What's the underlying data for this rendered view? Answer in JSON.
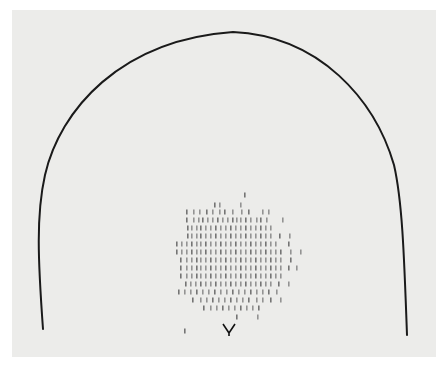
{
  "figure": {
    "background_color": "#ececea",
    "outline": {
      "color": "#1a1a1a",
      "stroke_width": 2,
      "path": "M43,329 C38,260 36,215 45,175 C60,110 120,40 233,32 C320,36 375,100 394,165 C402,200 404,250 407,335"
    },
    "tick_color": "#6e6e6e",
    "tick_rows": [
      {
        "y": 195,
        "xs": [
          244
        ]
      },
      {
        "y": 205,
        "xs": [
          214,
          219,
          240
        ]
      },
      {
        "y": 212,
        "xs": [
          186,
          193,
          199,
          206,
          212,
          219,
          224,
          232,
          241,
          248,
          262,
          268
        ]
      },
      {
        "y": 220,
        "xs": [
          186,
          193,
          198,
          202,
          207,
          212,
          217,
          222,
          227,
          232,
          236,
          240,
          245,
          250,
          256,
          260,
          266,
          282
        ]
      },
      {
        "y": 228,
        "xs": [
          187,
          191,
          196,
          200,
          205,
          210,
          215,
          220,
          225,
          230,
          235,
          240,
          245,
          250,
          255,
          260,
          265,
          270
        ]
      },
      {
        "y": 236,
        "xs": [
          187,
          191,
          196,
          200,
          205,
          210,
          215,
          220,
          225,
          230,
          235,
          240,
          245,
          250,
          255,
          260,
          265,
          270,
          279,
          289
        ]
      },
      {
        "y": 244,
        "xs": [
          176,
          181,
          186,
          191,
          196,
          200,
          205,
          210,
          215,
          220,
          225,
          230,
          235,
          240,
          245,
          250,
          255,
          260,
          265,
          270,
          275,
          288
        ]
      },
      {
        "y": 252,
        "xs": [
          176,
          181,
          186,
          191,
          196,
          200,
          205,
          210,
          215,
          220,
          225,
          230,
          235,
          240,
          245,
          250,
          255,
          260,
          265,
          270,
          275,
          280,
          290,
          300
        ]
      },
      {
        "y": 260,
        "xs": [
          180,
          186,
          191,
          196,
          200,
          205,
          210,
          215,
          220,
          225,
          230,
          235,
          240,
          245,
          250,
          255,
          260,
          265,
          270,
          275,
          280,
          290
        ]
      },
      {
        "y": 268,
        "xs": [
          180,
          186,
          191,
          196,
          200,
          205,
          210,
          215,
          220,
          225,
          230,
          235,
          240,
          245,
          250,
          255,
          260,
          265,
          270,
          275,
          280,
          288,
          296
        ]
      },
      {
        "y": 276,
        "xs": [
          180,
          186,
          191,
          196,
          200,
          205,
          210,
          215,
          220,
          225,
          230,
          235,
          240,
          245,
          250,
          255,
          260,
          265,
          270,
          275,
          280
        ]
      },
      {
        "y": 284,
        "xs": [
          185,
          190,
          195,
          200,
          205,
          210,
          215,
          220,
          225,
          230,
          235,
          240,
          245,
          250,
          255,
          260,
          265,
          270,
          278,
          288
        ]
      },
      {
        "y": 292,
        "xs": [
          178,
          184,
          190,
          196,
          202,
          208,
          214,
          220,
          226,
          232,
          238,
          244,
          250,
          256,
          262,
          268,
          276
        ]
      },
      {
        "y": 300,
        "xs": [
          192,
          200,
          206,
          212,
          218,
          224,
          230,
          236,
          242,
          248,
          256,
          262,
          270,
          280
        ]
      },
      {
        "y": 308,
        "xs": [
          203,
          210,
          216,
          222,
          228,
          234,
          240,
          246,
          252,
          258
        ]
      },
      {
        "y": 317,
        "xs": [
          236,
          257
        ]
      },
      {
        "y": 331,
        "xs": [
          184
        ]
      }
    ],
    "marker": {
      "shape": "Y",
      "x": 229,
      "y": 333,
      "color": "#111111"
    }
  }
}
